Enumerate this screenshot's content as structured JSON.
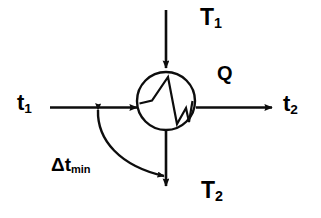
{
  "figure": {
    "background_color": "#ffffff",
    "stroke_color": "#000000",
    "width": 321,
    "height": 218
  },
  "labels": {
    "hot_inlet": {
      "base": "T",
      "sub": "1",
      "full": "T1"
    },
    "hot_outlet": {
      "base": "T",
      "sub": "2",
      "full": "T2"
    },
    "cold_inlet": {
      "base": "t",
      "sub": "1",
      "full": "t1"
    },
    "cold_outlet": {
      "base": "t",
      "sub": "2",
      "full": "t2"
    },
    "duty": {
      "base": "Q",
      "full": "Q"
    },
    "approach": {
      "base": "Δt",
      "sub": "min",
      "full": "Δtmin"
    }
  },
  "unit": {
    "shape": "circle",
    "symbol_name": "heat-exchanger-zigzag-symbol",
    "center_x": 166,
    "center_y": 101,
    "radius": 29
  },
  "arrows": [
    {
      "name": "hot-stream-inlet-arrow",
      "direction": "down",
      "from": [
        166,
        10
      ],
      "to": [
        166,
        70
      ]
    },
    {
      "name": "hot-stream-outlet-arrow",
      "direction": "down",
      "from": [
        166,
        131
      ],
      "to": [
        166,
        188
      ]
    },
    {
      "name": "cold-stream-inlet-arrow",
      "direction": "right",
      "from": [
        50,
        107
      ],
      "to": [
        139,
        107
      ]
    },
    {
      "name": "cold-stream-outlet-arrow",
      "direction": "right",
      "from": [
        196,
        107
      ],
      "to": [
        274,
        107
      ]
    },
    {
      "name": "approach-temperature-curved-arrow",
      "direction": "double",
      "from": [
        97,
        108
      ],
      "to": [
        170,
        177
      ]
    }
  ]
}
